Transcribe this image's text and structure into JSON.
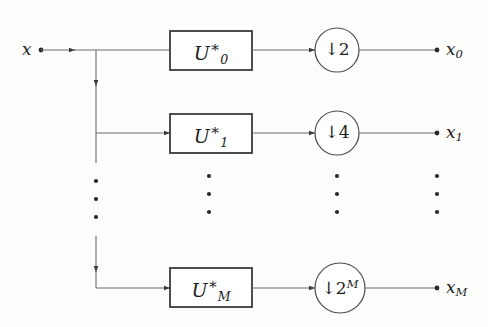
{
  "figure": {
    "type": "block-diagram",
    "background_color": "#fdfdfc",
    "stroke_color": "#3a3a3a",
    "text_color": "#1d1d1d"
  },
  "input": {
    "label": "x",
    "terminal": "dot"
  },
  "rows": [
    {
      "id": "row-0",
      "filter": {
        "symbol": "U",
        "subscript": "0",
        "superscript": "∗"
      },
      "decimator": {
        "arrow": "↓",
        "factor": "2",
        "exponent": ""
      },
      "output": {
        "symbol": "x",
        "subscript": "0"
      }
    },
    {
      "id": "row-1",
      "filter": {
        "symbol": "U",
        "subscript": "1",
        "superscript": "∗"
      },
      "decimator": {
        "arrow": "↓",
        "factor": "4",
        "exponent": ""
      },
      "output": {
        "symbol": "x",
        "subscript": "1"
      }
    },
    {
      "id": "row-m",
      "filter": {
        "symbol": "U",
        "subscript": "M",
        "superscript": "∗"
      },
      "decimator": {
        "arrow": "↓",
        "factor": "2",
        "exponent": "M"
      },
      "output": {
        "symbol": "x",
        "subscript": "M"
      }
    }
  ],
  "ellipses": [
    {
      "id": "ellipsis-branch",
      "dots": 3
    },
    {
      "id": "ellipsis-filters",
      "dots": 3
    },
    {
      "id": "ellipsis-decimators",
      "dots": 3
    },
    {
      "id": "ellipsis-outputs",
      "dots": 3
    }
  ]
}
